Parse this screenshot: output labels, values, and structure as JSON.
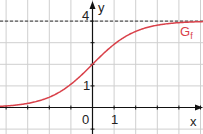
{
  "chart_data": {
    "type": "line",
    "title": "",
    "xlabel": "x",
    "ylabel": "y",
    "xlim": [
      -4.0,
      5.0
    ],
    "ylim": [
      -1.0,
      5.0
    ],
    "grid": true,
    "grid_step": 1,
    "x_tick_labels": [
      "0",
      "1"
    ],
    "y_tick_labels": [
      "1",
      "4"
    ],
    "series": [
      {
        "name": "G_f",
        "label_main": "G",
        "label_sub": "f",
        "color": "#d9414a",
        "function": "f(x) = 4 / (1 + e^(-x))",
        "x": [
          -4,
          -3,
          -2,
          -1,
          0,
          1,
          2,
          3,
          4,
          5
        ],
        "values": [
          0.07,
          0.19,
          0.48,
          1.08,
          2.0,
          2.92,
          3.52,
          3.81,
          3.93,
          3.97
        ]
      }
    ],
    "asymptote": {
      "y": 4,
      "style": "dashed",
      "color": "#333333"
    },
    "colors": {
      "grid": "#cfcfcf",
      "axis": "#111111",
      "curve": "#d9414a"
    }
  }
}
